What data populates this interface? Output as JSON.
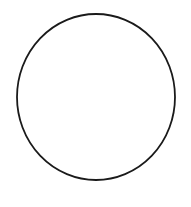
{
  "canvas": {
    "width": 191,
    "height": 207,
    "background_color": "#FFFFFF",
    "title": "Circle outline",
    "description": "A single hand-drawn style black circle outline centered on a plain white background."
  },
  "shapes": [
    {
      "name": "circle-outline",
      "type": "circle",
      "center_x": 96,
      "center_y": 97,
      "radius_x": 79,
      "radius_y": 83,
      "stroke_color": "#1A1A1A",
      "stroke_width": 1.8,
      "fill_color": "none",
      "label": "Circle"
    }
  ],
  "bounds": {
    "left": 17,
    "right": 175,
    "top": 14,
    "bottom": 181
  },
  "annotations": {
    "text_items": [],
    "note": ""
  }
}
